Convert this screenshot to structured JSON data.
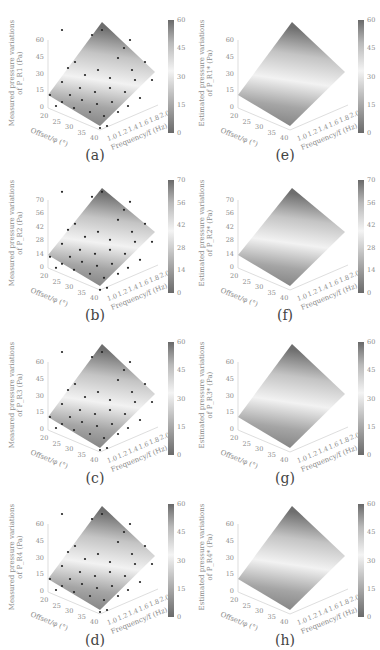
{
  "figure": {
    "captions": [
      "(a)",
      "(b)",
      "(c)",
      "(d)",
      "(e)",
      "(f)",
      "(g)",
      "(h)"
    ]
  },
  "chart_data": [
    {
      "id": "a",
      "type": "surface",
      "caption": "(a)",
      "zlabel_line1": "Measured pressure variations",
      "zlabel_line2": "of P_R1 (Pa)",
      "xlabel": "Offset/φ (°)",
      "ylabel": "Frequency/f (Hz)",
      "x_ticks": [
        "20",
        "25",
        "30",
        "35",
        "40"
      ],
      "y_ticks": [
        "1.0",
        "1.2",
        "1.4",
        "1.6",
        "1.8",
        "2.0"
      ],
      "z_ticks": [
        "0",
        "15",
        "30",
        "45",
        "60"
      ],
      "colorbar_ticks": [
        "0",
        "15",
        "30",
        "45",
        "60"
      ],
      "zlim": [
        0,
        60
      ],
      "scatter": true
    },
    {
      "id": "b",
      "type": "surface",
      "caption": "(b)",
      "zlabel_line1": "Measured pressure variations",
      "zlabel_line2": "of P_R2 (Pa)",
      "xlabel": "Offset/φ (°)",
      "ylabel": "Frequency/f (Hz)",
      "x_ticks": [
        "20",
        "25",
        "30",
        "35",
        "40"
      ],
      "y_ticks": [
        "1.0",
        "1.2",
        "1.4",
        "1.6",
        "1.8",
        "2.0"
      ],
      "z_ticks": [
        "0",
        "14",
        "28",
        "42",
        "56",
        "70"
      ],
      "colorbar_ticks": [
        "0",
        "14",
        "28",
        "42",
        "56",
        "70"
      ],
      "zlim": [
        0,
        70
      ],
      "scatter": true
    },
    {
      "id": "c",
      "type": "surface",
      "caption": "(c)",
      "zlabel_line1": "Measured pressure variations",
      "zlabel_line2": "of P_R3 (Pa)",
      "xlabel": "Offset/φ (°)",
      "ylabel": "Frequency/f (Hz)",
      "x_ticks": [
        "20",
        "25",
        "30",
        "35",
        "40"
      ],
      "y_ticks": [
        "1.0",
        "1.2",
        "1.4",
        "1.6",
        "1.8",
        "2.0"
      ],
      "z_ticks": [
        "0",
        "15",
        "30",
        "45",
        "60"
      ],
      "colorbar_ticks": [
        "0",
        "15",
        "30",
        "45",
        "60"
      ],
      "zlim": [
        0,
        60
      ],
      "scatter": true
    },
    {
      "id": "d",
      "type": "surface",
      "caption": "(d)",
      "zlabel_line1": "Measured pressure variations",
      "zlabel_line2": "of P_R4 (Pa)",
      "xlabel": "Offset/φ (°)",
      "ylabel": "Frequency/f (Hz)",
      "x_ticks": [
        "20",
        "25",
        "30",
        "35",
        "40"
      ],
      "y_ticks": [
        "1.0",
        "1.2",
        "1.4",
        "1.6",
        "1.8",
        "2.0"
      ],
      "z_ticks": [
        "0",
        "15",
        "30",
        "45",
        "60"
      ],
      "colorbar_ticks": [
        "0",
        "15",
        "30",
        "45",
        "60"
      ],
      "zlim": [
        0,
        60
      ],
      "scatter": true
    },
    {
      "id": "e",
      "type": "surface",
      "caption": "(e)",
      "zlabel_line1": "Estimated pressure variations",
      "zlabel_line2": "of P_R1* (Pa)",
      "xlabel": "Offset/φ (°)",
      "ylabel": "Frequency/f (Hz)",
      "x_ticks": [
        "20",
        "25",
        "30",
        "35",
        "40"
      ],
      "y_ticks": [
        "1.0",
        "1.2",
        "1.4",
        "1.6",
        "1.8",
        "2.0"
      ],
      "z_ticks": [
        "0",
        "15",
        "30",
        "45",
        "60"
      ],
      "colorbar_ticks": [
        "0",
        "15",
        "30",
        "45",
        "60"
      ],
      "zlim": [
        0,
        60
      ],
      "scatter": false
    },
    {
      "id": "f",
      "type": "surface",
      "caption": "(f)",
      "zlabel_line1": "Estimated pressure variations",
      "zlabel_line2": "of P_R2* (Pa)",
      "xlabel": "Offset/φ (°)",
      "ylabel": "Frequency/f (Hz)",
      "x_ticks": [
        "20",
        "25",
        "30",
        "35",
        "40"
      ],
      "y_ticks": [
        "1.0",
        "1.2",
        "1.4",
        "1.6",
        "1.8",
        "2.0"
      ],
      "z_ticks": [
        "0",
        "14",
        "28",
        "42",
        "56",
        "70"
      ],
      "colorbar_ticks": [
        "0",
        "14",
        "28",
        "42",
        "56",
        "70"
      ],
      "zlim": [
        0,
        70
      ],
      "scatter": false
    },
    {
      "id": "g",
      "type": "surface",
      "caption": "(g)",
      "zlabel_line1": "Estimated pressure variations",
      "zlabel_line2": "of P_R3* (Pa)",
      "xlabel": "Offset/φ (°)",
      "ylabel": "Frequency/f (Hz)",
      "x_ticks": [
        "20",
        "25",
        "30",
        "35",
        "40"
      ],
      "y_ticks": [
        "1.0",
        "1.2",
        "1.4",
        "1.6",
        "1.8",
        "2.0"
      ],
      "z_ticks": [
        "0",
        "15",
        "30",
        "45",
        "60"
      ],
      "colorbar_ticks": [
        "0",
        "15",
        "30",
        "45",
        "60"
      ],
      "zlim": [
        0,
        60
      ],
      "scatter": false
    },
    {
      "id": "h",
      "type": "surface",
      "caption": "(h)",
      "zlabel_line1": "Estimated pressure variations",
      "zlabel_line2": "of P_R4* (Pa)",
      "xlabel": "Offset/φ (°)",
      "ylabel": "Frequency/f (Hz)",
      "x_ticks": [
        "20",
        "25",
        "30",
        "35",
        "40"
      ],
      "y_ticks": [
        "1.0",
        "1.2",
        "1.4",
        "1.6",
        "1.8",
        "2.0"
      ],
      "z_ticks": [
        "0",
        "15",
        "30",
        "45",
        "60"
      ],
      "colorbar_ticks": [
        "0",
        "15",
        "30",
        "45",
        "60"
      ],
      "zlim": [
        0,
        60
      ],
      "scatter": false
    }
  ],
  "colors": {
    "surface_low": "#7a7a7a",
    "surface_mid": "#f2f2f2",
    "surface_high": "#6e6e6e",
    "scatter": "#222222",
    "axis_text": "#8a8a8a",
    "caption_text": "#444444"
  }
}
